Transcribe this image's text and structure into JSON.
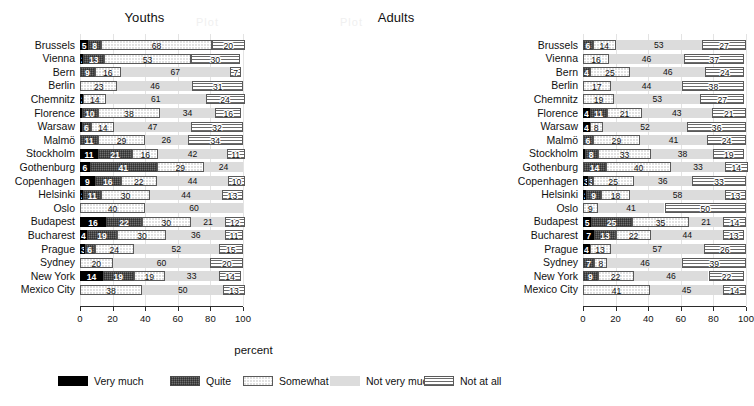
{
  "figure": {
    "xlabel": "percent",
    "panels": [
      {
        "title": "Youths"
      },
      {
        "title": "Adults"
      }
    ]
  },
  "axis": {
    "ticks": [
      0,
      20,
      40,
      60,
      80,
      100
    ],
    "tick_labels": [
      "0",
      "20",
      "40",
      "60",
      "80",
      "100"
    ],
    "min": 0,
    "max": 100
  },
  "legend": {
    "items": [
      {
        "label": "Very much",
        "key": "very_much",
        "color": "#000000"
      },
      {
        "label": "Quite",
        "key": "quite",
        "color": "#6e6e6e"
      },
      {
        "label": "Somewhat",
        "key": "somewhat",
        "color": "#ffffff"
      },
      {
        "label": "Not very much",
        "key": "not_very_much",
        "color": "#dcdcdc"
      },
      {
        "label": "Not at all",
        "key": "not_at_all",
        "color": "#ffffff"
      }
    ]
  },
  "chart_data": {
    "type": "bar",
    "orientation": "horizontal",
    "stacked": true,
    "title": "",
    "xlabel": "percent",
    "ylabel": "",
    "xlim": [
      0,
      100
    ],
    "grid": true,
    "legend_position": "bottom",
    "series": [
      {
        "name": "Very much"
      },
      {
        "name": "Quite"
      },
      {
        "name": "Somewhat"
      },
      {
        "name": "Not very much"
      },
      {
        "name": "Not at all"
      }
    ],
    "categories": [
      "Brussels",
      "Vienna",
      "Bern",
      "Berlin",
      "Chemnitz",
      "Florence",
      "Warsaw",
      "Malmö",
      "Stockholm",
      "Gothenburg",
      "Copenhagen",
      "Helsinki",
      "Oslo",
      "Budapest",
      "Bucharest",
      "Prague",
      "Sydney",
      "New York",
      "Mexico City"
    ],
    "panels": [
      {
        "name": "Youths",
        "rows": [
          {
            "category": "Brussels",
            "values": [
              5,
              8,
              68,
              0,
              20
            ]
          },
          {
            "category": "Vienna",
            "values": [
              2,
              13,
              53,
              0,
              30
            ]
          },
          {
            "category": "Bern",
            "values": [
              0,
              9,
              16,
              67,
              7
            ]
          },
          {
            "category": "Berlin",
            "values": [
              0,
              0,
              23,
              46,
              31
            ]
          },
          {
            "category": "Chemnitz",
            "values": [
              2,
              0,
              14,
              61,
              24
            ]
          },
          {
            "category": "Florence",
            "values": [
              1,
              10,
              38,
              34,
              16
            ]
          },
          {
            "category": "Warsaw",
            "values": [
              1,
              6,
              14,
              47,
              32
            ]
          },
          {
            "category": "Malmö",
            "values": [
              0,
              11,
              29,
              26,
              34
            ]
          },
          {
            "category": "Stockholm",
            "values": [
              11,
              21,
              16,
              42,
              11
            ]
          },
          {
            "category": "Gothenburg",
            "values": [
              6,
              41,
              29,
              24,
              0
            ]
          },
          {
            "category": "Copenhagen",
            "values": [
              9,
              16,
              22,
              44,
              10
            ]
          },
          {
            "category": "Helsinki",
            "values": [
              2,
              11,
              30,
              44,
              13
            ]
          },
          {
            "category": "Oslo",
            "values": [
              0,
              0,
              40,
              60,
              0
            ]
          },
          {
            "category": "Budapest",
            "values": [
              16,
              22,
              30,
              21,
              12
            ]
          },
          {
            "category": "Bucharest",
            "values": [
              4,
              19,
              30,
              36,
              11
            ]
          },
          {
            "category": "Prague",
            "values": [
              3,
              6,
              24,
              52,
              15
            ]
          },
          {
            "category": "Sydney",
            "values": [
              0,
              0,
              20,
              60,
              20
            ]
          },
          {
            "category": "New York",
            "values": [
              14,
              19,
              19,
              33,
              14
            ]
          },
          {
            "category": "Mexico City",
            "values": [
              0,
              0,
              38,
              50,
              13
            ]
          }
        ]
      },
      {
        "name": "Adults",
        "rows": [
          {
            "category": "Brussels",
            "values": [
              0,
              6,
              14,
              53,
              27
            ]
          },
          {
            "category": "Vienna",
            "values": [
              0,
              0,
              16,
              46,
              37
            ]
          },
          {
            "category": "Bern",
            "values": [
              0,
              4,
              25,
              46,
              24
            ]
          },
          {
            "category": "Berlin",
            "values": [
              0,
              0,
              17,
              44,
              38
            ]
          },
          {
            "category": "Chemnitz",
            "values": [
              0,
              0,
              19,
              53,
              27
            ]
          },
          {
            "category": "Florence",
            "values": [
              4,
              11,
              21,
              43,
              21
            ]
          },
          {
            "category": "Warsaw",
            "values": [
              4,
              0,
              8,
              52,
              36
            ]
          },
          {
            "category": "Malmö",
            "values": [
              0,
              6,
              29,
              41,
              24
            ]
          },
          {
            "category": "Stockholm",
            "values": [
              1,
              8,
              33,
              38,
              19
            ]
          },
          {
            "category": "Gothenburg",
            "values": [
              0,
              14,
              40,
              33,
              14
            ]
          },
          {
            "category": "Copenhagen",
            "values": [
              3,
              3,
              25,
              36,
              33
            ]
          },
          {
            "category": "Helsinki",
            "values": [
              2,
              9,
              18,
              58,
              13
            ]
          },
          {
            "category": "Oslo",
            "values": [
              0,
              0,
              9,
              41,
              50
            ]
          },
          {
            "category": "Budapest",
            "values": [
              5,
              25,
              35,
              21,
              14
            ]
          },
          {
            "category": "Bucharest",
            "values": [
              7,
              13,
              22,
              44,
              13
            ]
          },
          {
            "category": "Prague",
            "values": [
              4,
              0,
              13,
              57,
              26
            ]
          },
          {
            "category": "Sydney",
            "values": [
              0,
              7,
              8,
              46,
              39
            ]
          },
          {
            "category": "New York",
            "values": [
              0,
              9,
              22,
              46,
              22
            ]
          },
          {
            "category": "Mexico City",
            "values": [
              0,
              0,
              41,
              45,
              14
            ]
          }
        ]
      }
    ]
  }
}
